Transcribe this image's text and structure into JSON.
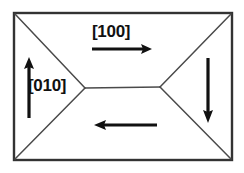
{
  "figure": {
    "kind": "magnetic-domain-diagram",
    "background_color": "#ffffff",
    "line_color": "#1a1a1a",
    "arrow_color": "#111111",
    "border_color": "#333333"
  },
  "labels": {
    "direction_100": "[100]",
    "direction_010": "[010]"
  },
  "geometry": {
    "rect": {
      "x": 14,
      "y": 13,
      "width": 218,
      "height": 147
    },
    "vertex_left": {
      "x": 85,
      "y": 88
    },
    "vertex_right": {
      "x": 160,
      "y": 87
    }
  },
  "arrows": [
    {
      "name": "arrow-right-top",
      "direction": "right",
      "label": "[100]",
      "x1": 92,
      "y1": 49,
      "x2": 152,
      "y2": 49
    },
    {
      "name": "arrow-up-left",
      "direction": "up",
      "label": "[010]",
      "x1": 29,
      "y1": 118,
      "x2": 29,
      "y2": 58
    },
    {
      "name": "arrow-down-right",
      "direction": "down",
      "label": "",
      "x1": 208,
      "y1": 58,
      "x2": 208,
      "y2": 122
    },
    {
      "name": "arrow-left-bottom",
      "direction": "left",
      "label": "",
      "x1": 157,
      "y1": 125,
      "x2": 95,
      "y2": 125
    }
  ]
}
